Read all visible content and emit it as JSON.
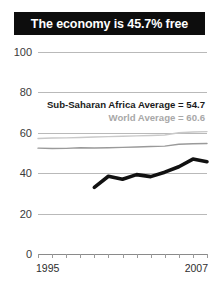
{
  "header": {
    "title": "The economy is 45.7% free"
  },
  "annotations": {
    "africa_average_label": "Sub-Saharan Africa Average = 54.7",
    "world_average_label": "World Average = 60.6"
  },
  "colors": {
    "title_bar_background": "#0d0d0d",
    "title_text": "#ffffff",
    "country_line": "#111111",
    "africa_line": "#9a9a9a",
    "world_line": "#c9c9c9",
    "gridline": "#b9b9b9"
  },
  "chart_data": {
    "type": "line",
    "title": "The economy is 45.7% free",
    "xlabel": "",
    "ylabel": "",
    "xlim": [
      1995,
      2007
    ],
    "ylim": [
      0,
      100
    ],
    "yticks": [
      0,
      20,
      40,
      60,
      80,
      100
    ],
    "ytick_labels": [
      "0",
      "20",
      "40",
      "60",
      "80",
      "100"
    ],
    "xticks": [
      1995,
      1996,
      1997,
      1998,
      1999,
      2000,
      2001,
      2002,
      2003,
      2004,
      2005,
      2006,
      2007
    ],
    "xtick_labels": [
      "1995",
      "2007"
    ],
    "grid": true,
    "legend": "none",
    "x": [
      1995,
      1996,
      1997,
      1998,
      1999,
      2000,
      2001,
      2002,
      2003,
      2004,
      2005,
      2006,
      2007
    ],
    "series": [
      {
        "name": "Country economic freedom",
        "color": "#111111",
        "values": [
          null,
          null,
          null,
          null,
          33.0,
          38.5,
          37.0,
          39.3,
          38.3,
          40.5,
          43.2,
          47.0,
          45.7
        ]
      },
      {
        "name": "Sub-Saharan Africa Average",
        "color": "#9a9a9a",
        "values": [
          52.4,
          52.2,
          52.3,
          52.6,
          52.5,
          52.6,
          52.8,
          53.0,
          53.2,
          53.4,
          54.3,
          54.6,
          54.7
        ]
      },
      {
        "name": "World Average",
        "color": "#c9c9c9",
        "values": [
          57.2,
          57.4,
          57.5,
          57.7,
          57.9,
          58.1,
          58.3,
          58.5,
          58.7,
          58.9,
          60.0,
          60.4,
          60.6
        ]
      }
    ],
    "annotations": [
      {
        "text": "Sub-Saharan Africa Average = 54.7",
        "value": 54.7
      },
      {
        "text": "World Average = 60.6",
        "value": 60.6
      }
    ]
  }
}
